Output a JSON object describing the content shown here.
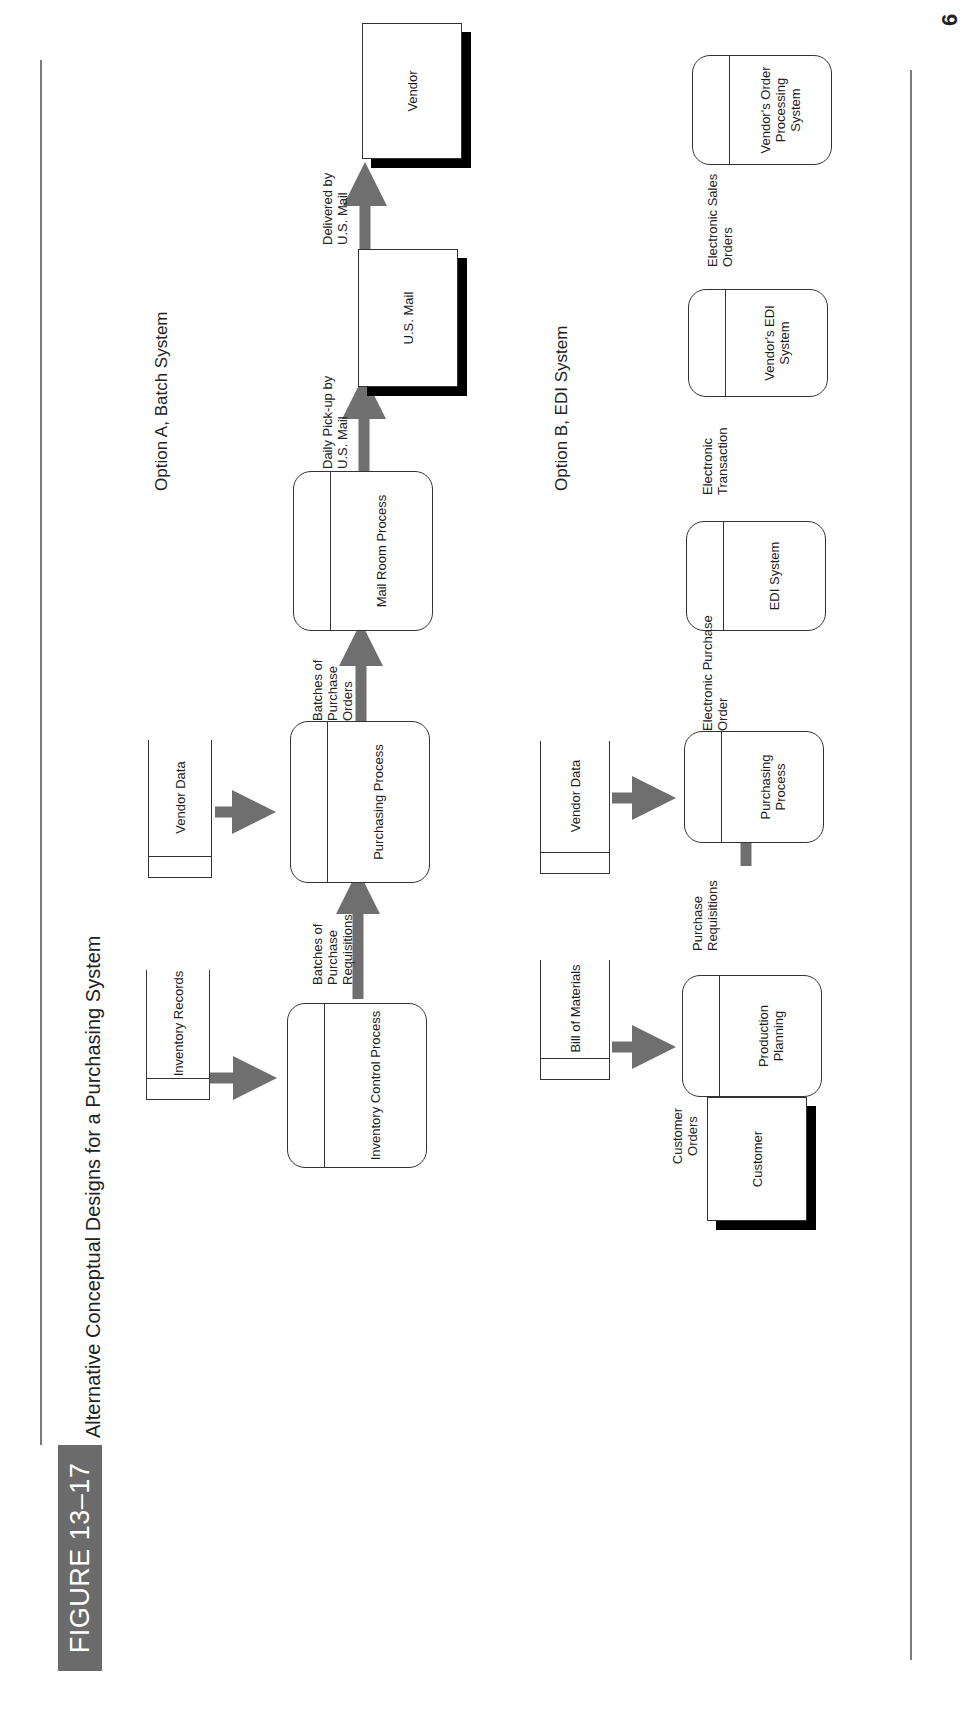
{
  "page": {
    "corner_mark": "6"
  },
  "figure": {
    "number": "FIGURE 13–17",
    "title": "Alternative Conceptual Designs for a Purchasing System",
    "colors": {
      "badge": "#6b6b6b",
      "arrow": "#6f6f6f",
      "line": "#333333",
      "shadow": "#000000"
    }
  },
  "option_a": {
    "title": "Option A, Batch System",
    "data_stores": [
      {
        "label": "Inventory Records"
      },
      {
        "label": "Vendor Data"
      }
    ],
    "processes": [
      {
        "label": "Inventory Control Process"
      },
      {
        "label": "Purchasing Process"
      },
      {
        "label": "Mail Room Process"
      }
    ],
    "entities": [
      {
        "label": "U.S. Mail"
      },
      {
        "label": "Vendor"
      }
    ],
    "flows": [
      {
        "label": "Batches of Purchase Requisitions",
        "from": "Inventory Control Process",
        "to": "Purchasing Process"
      },
      {
        "label": "Batches of Purchase Orders",
        "from": "Purchasing Process",
        "to": "Mail Room Process"
      },
      {
        "label": "Daily Pick-up by U.S. Mail",
        "from": "Mail Room Process",
        "to": "U.S. Mail"
      },
      {
        "label": "Delivered by U.S. Mail",
        "from": "U.S. Mail",
        "to": "Vendor"
      },
      {
        "label": "",
        "from": "Inventory Records",
        "to": "Inventory Control Process"
      },
      {
        "label": "",
        "from": "Vendor Data",
        "to": "Purchasing Process"
      }
    ]
  },
  "option_b": {
    "title": "Option B, EDI System",
    "data_stores": [
      {
        "label": "Bill of Materials"
      },
      {
        "label": "Vendor Data"
      }
    ],
    "processes": [
      {
        "label": "Production Planning"
      },
      {
        "label": "Purchasing Process"
      },
      {
        "label": "EDI System"
      },
      {
        "label": "Vendor's EDI System"
      },
      {
        "label": "Vendor's Order Processing System"
      }
    ],
    "entities": [
      {
        "label": "Customer"
      }
    ],
    "flows": [
      {
        "label": "Customer Orders",
        "from": "Customer",
        "to": "Production Planning"
      },
      {
        "label": "Purchase Requisitions",
        "from": "Production Planning",
        "to": "Purchasing Process"
      },
      {
        "label": "Electronic Purchase Order",
        "from": "Purchasing Process",
        "to": "EDI System"
      },
      {
        "label": "Electronic Transaction",
        "from": "EDI System",
        "to": "Vendor's EDI System"
      },
      {
        "label": "Electronic Sales Orders",
        "from": "Vendor's EDI System",
        "to": "Vendor's Order Processing System"
      },
      {
        "label": "",
        "from": "Bill of Materials",
        "to": "Production Planning"
      },
      {
        "label": "",
        "from": "Vendor Data",
        "to": "Purchasing Process"
      }
    ]
  }
}
